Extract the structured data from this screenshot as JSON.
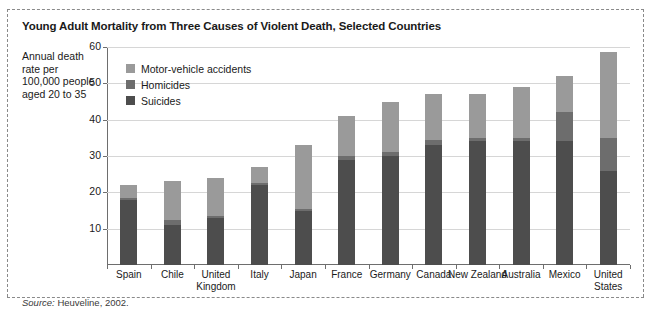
{
  "title": "Young Adult Mortality from Three Causes of Violent Death, Selected Countries",
  "axis_label": "Annual death rate per 100,000 people aged 20 to 35",
  "source_prefix": "Source:",
  "source_text": "Heuveline, 2002.",
  "colors": {
    "motor_vehicle": "#9a9a9a",
    "homicides": "#6d6d6d",
    "suicides": "#4d4d4d",
    "axis": "#6e6e6e",
    "grid": "#d6d6d6"
  },
  "legend": [
    {
      "label": "Motor-vehicle accidents",
      "key": "motor_vehicle"
    },
    {
      "label": "Homicides",
      "key": "homicides"
    },
    {
      "label": "Suicides",
      "key": "suicides"
    }
  ],
  "chart_data": {
    "type": "bar",
    "subtype": "stacked-bar",
    "title": "Young Adult Mortality from Three Causes of Violent Death, Selected Countries",
    "xlabel": "",
    "ylabel": "Annual death rate per 100,000 people aged 20 to 35",
    "ylim": [
      0,
      60
    ],
    "yticks": [
      10,
      20,
      30,
      40,
      50,
      60
    ],
    "grid": true,
    "legend_position": "inside-top-left",
    "categories": [
      "Spain",
      "Chile",
      "United Kingdom",
      "Italy",
      "Japan",
      "France",
      "Germany",
      "Canada",
      "New Zealand",
      "Australia",
      "Mexico",
      "United States"
    ],
    "series": [
      {
        "name": "Suicides",
        "values": [
          18,
          11,
          13,
          22,
          15,
          29,
          30,
          33,
          34,
          34,
          34,
          26
        ]
      },
      {
        "name": "Homicides",
        "values": [
          0.5,
          1.5,
          0.5,
          0.5,
          0.5,
          1.0,
          1.0,
          1.5,
          1.0,
          1.0,
          8.0,
          9.0
        ]
      },
      {
        "name": "Motor-vehicle accidents",
        "values": [
          3.5,
          10.5,
          10.5,
          4.5,
          17.5,
          11.0,
          14.0,
          12.5,
          12.0,
          14.0,
          10.0,
          23.5
        ]
      }
    ],
    "totals": [
      22,
      23,
      24,
      27,
      33,
      41,
      45,
      47,
      47,
      49,
      52,
      58.5
    ]
  }
}
